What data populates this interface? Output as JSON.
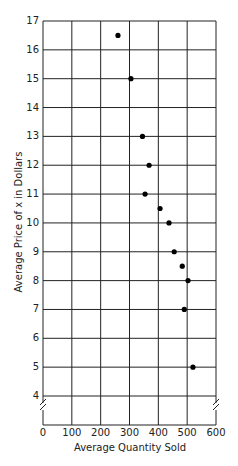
{
  "chart_data": {
    "type": "scatter",
    "title": "",
    "xlabel": "Average Quantity Sold",
    "ylabel": "Average Price of x in Dollars",
    "xlim": [
      0,
      600
    ],
    "ylim": [
      4,
      17
    ],
    "x_ticks": [
      "0",
      "100",
      "200",
      "300",
      "400",
      "500",
      "600"
    ],
    "y_ticks": [
      "4",
      "5",
      "6",
      "7",
      "8",
      "9",
      "10",
      "11",
      "12",
      "13",
      "14",
      "15",
      "16",
      "17"
    ],
    "grid": true,
    "axis_breaks": true,
    "points": [
      {
        "x": 260,
        "y": 16.5
      },
      {
        "x": 305,
        "y": 15
      },
      {
        "x": 345,
        "y": 13
      },
      {
        "x": 368,
        "y": 12
      },
      {
        "x": 354,
        "y": 11
      },
      {
        "x": 406,
        "y": 10.5
      },
      {
        "x": 437,
        "y": 10
      },
      {
        "x": 455,
        "y": 9
      },
      {
        "x": 483,
        "y": 8.5
      },
      {
        "x": 503,
        "y": 8
      },
      {
        "x": 490,
        "y": 7
      },
      {
        "x": 520,
        "y": 5
      }
    ]
  }
}
